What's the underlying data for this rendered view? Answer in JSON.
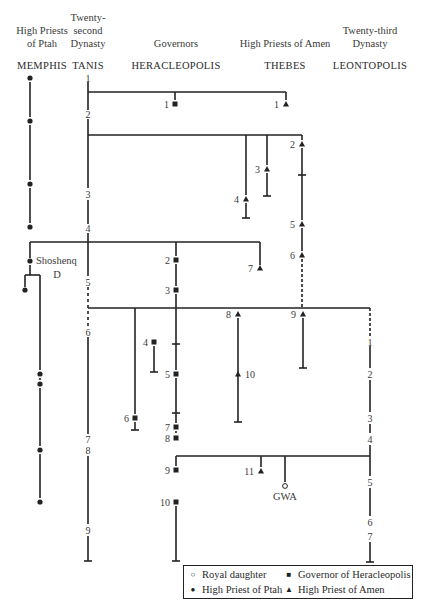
{
  "headers": [
    {
      "id": "memphis",
      "title": "High Priests\nof Ptah",
      "city": "MEMPHIS",
      "x": 42
    },
    {
      "id": "tanis",
      "title": "Twenty-\nsecond\nDynasty",
      "city": "TANIS",
      "x": 88
    },
    {
      "id": "heracleopolis",
      "title": "Governors",
      "city": "HERACLEOPOLIS",
      "x": 176
    },
    {
      "id": "thebes",
      "title": "High Priests of Amen",
      "city": "THEBES",
      "x": 285
    },
    {
      "id": "leontopolis",
      "title": "Twenty-third\nDynasty",
      "city": "LEONTOPOLIS",
      "x": 370
    }
  ],
  "legend": {
    "items": [
      {
        "symbol": "○",
        "label": "Royal daughter"
      },
      {
        "symbol": "■",
        "label": "Governor of Heracleopolis"
      },
      {
        "symbol": "●",
        "label": "High Priest of Ptah"
      },
      {
        "symbol": "▲",
        "label": "High Priest of Amen"
      }
    ]
  },
  "annotations": {
    "shoshenq": "Shoshenq",
    "shoshenq_sub": "D",
    "gwa": "GWA"
  },
  "colors": {
    "line": "#222222",
    "text": "#3a3a3a",
    "background": "#ffffff"
  },
  "tanis_kings": [
    {
      "n": "1",
      "y": 78
    },
    {
      "n": "2",
      "y": 114
    },
    {
      "n": "3",
      "y": 194
    },
    {
      "n": "4",
      "y": 228
    },
    {
      "n": "5",
      "y": 282
    },
    {
      "n": "6",
      "y": 332
    },
    {
      "n": "7",
      "y": 439
    },
    {
      "n": "8",
      "y": 450
    },
    {
      "n": "9",
      "y": 530
    }
  ],
  "leontopolis_kings": [
    {
      "n": "1",
      "y": 342
    },
    {
      "n": "2",
      "y": 374
    },
    {
      "n": "3",
      "y": 418
    },
    {
      "n": "4",
      "y": 439
    },
    {
      "n": "5",
      "y": 482
    },
    {
      "n": "6",
      "y": 522
    },
    {
      "n": "7",
      "y": 536
    }
  ],
  "governors": [
    {
      "n": "1",
      "x": 175,
      "y": 104
    },
    {
      "n": "2",
      "x": 176,
      "y": 260
    },
    {
      "n": "3",
      "x": 176,
      "y": 290
    },
    {
      "n": "4",
      "x": 154,
      "y": 342
    },
    {
      "n": "5",
      "x": 176,
      "y": 374
    },
    {
      "n": "6",
      "x": 135,
      "y": 418
    },
    {
      "n": "7",
      "x": 176,
      "y": 427
    },
    {
      "n": "8",
      "x": 176,
      "y": 438
    },
    {
      "n": "9",
      "x": 176,
      "y": 470
    },
    {
      "n": "10",
      "x": 176,
      "y": 502
    }
  ],
  "amen_priests": [
    {
      "n": "1",
      "x": 286,
      "y": 104
    },
    {
      "n": "2",
      "x": 302,
      "y": 144
    },
    {
      "n": "3",
      "x": 267,
      "y": 169
    },
    {
      "n": "4",
      "x": 246,
      "y": 199
    },
    {
      "n": "5",
      "x": 302,
      "y": 224
    },
    {
      "n": "6",
      "x": 302,
      "y": 255
    },
    {
      "n": "7",
      "x": 260,
      "y": 268
    },
    {
      "n": "8",
      "x": 238,
      "y": 314
    },
    {
      "n": "9",
      "x": 303,
      "y": 314
    },
    {
      "n": "10",
      "x": 238,
      "y": 374
    },
    {
      "n": "11",
      "x": 261,
      "y": 471
    }
  ],
  "ptah_priests": [
    {
      "x": 30,
      "y": 78
    },
    {
      "x": 30,
      "y": 121
    },
    {
      "x": 30,
      "y": 184
    },
    {
      "x": 30,
      "y": 227
    },
    {
      "x": 30,
      "y": 261
    },
    {
      "x": 25,
      "y": 290
    },
    {
      "x": 40,
      "y": 374
    },
    {
      "x": 40,
      "y": 384
    },
    {
      "x": 40,
      "y": 450
    },
    {
      "x": 40,
      "y": 502
    }
  ]
}
